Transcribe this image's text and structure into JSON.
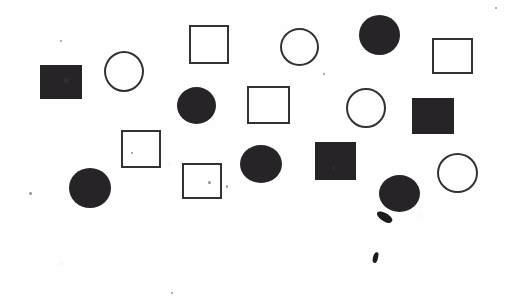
{
  "canvas": {
    "width": 511,
    "height": 299,
    "background_color": "#fefefe",
    "description": "Scanned white page with hand-drawn/printed geometric shapes"
  },
  "palette": {
    "fill_color": "#262426",
    "stroke_color": "#333134",
    "background_color": "#fefefe",
    "speck_color": "#3a3a3a"
  },
  "shape_counts": {
    "filled_square": 4,
    "open_square": 5,
    "filled_circle": 5,
    "open_circle": 4,
    "total": 18
  },
  "shapes": [
    {
      "id": "filled-square-1",
      "kind": "filled-square",
      "x": 40,
      "y": 65,
      "w": 42,
      "h": 34
    },
    {
      "id": "open-circle-1",
      "kind": "open-circle",
      "x": 104,
      "y": 51,
      "w": 40,
      "h": 41
    },
    {
      "id": "open-square-1",
      "kind": "open-square",
      "x": 189,
      "y": 25,
      "w": 40,
      "h": 39
    },
    {
      "id": "open-circle-2",
      "kind": "open-circle",
      "x": 280,
      "y": 28,
      "w": 39,
      "h": 38
    },
    {
      "id": "filled-circle-1",
      "kind": "filled-circle",
      "x": 359,
      "y": 15,
      "w": 41,
      "h": 40
    },
    {
      "id": "open-square-2",
      "kind": "open-square",
      "x": 432,
      "y": 38,
      "w": 41,
      "h": 36
    },
    {
      "id": "filled-circle-2",
      "kind": "filled-circle",
      "x": 177,
      "y": 87,
      "w": 39,
      "h": 37
    },
    {
      "id": "open-square-3",
      "kind": "open-square",
      "x": 247,
      "y": 86,
      "w": 43,
      "h": 38
    },
    {
      "id": "open-circle-3",
      "kind": "open-circle",
      "x": 346,
      "y": 88,
      "w": 40,
      "h": 40
    },
    {
      "id": "filled-square-2",
      "kind": "filled-square",
      "x": 412,
      "y": 98,
      "w": 42,
      "h": 36
    },
    {
      "id": "open-square-4",
      "kind": "open-square",
      "x": 121,
      "y": 130,
      "w": 40,
      "h": 38
    },
    {
      "id": "filled-circle-3",
      "kind": "filled-circle",
      "x": 240,
      "y": 145,
      "w": 42,
      "h": 38
    },
    {
      "id": "filled-square-3",
      "kind": "filled-square",
      "x": 315,
      "y": 142,
      "w": 41,
      "h": 38
    },
    {
      "id": "open-circle-4",
      "kind": "open-circle",
      "x": 437,
      "y": 153,
      "w": 41,
      "h": 40
    },
    {
      "id": "open-square-5",
      "kind": "open-square",
      "x": 182,
      "y": 163,
      "w": 40,
      "h": 36
    },
    {
      "id": "filled-circle-4",
      "kind": "filled-circle",
      "x": 69,
      "y": 168,
      "w": 42,
      "h": 40
    },
    {
      "id": "filled-circle-5",
      "kind": "filled-circle",
      "x": 379,
      "y": 175,
      "w": 41,
      "h": 37
    },
    {
      "id": "filled-square-4",
      "kind": "filled-square",
      "x": 40,
      "y": 65,
      "w": 0,
      "h": 0
    }
  ],
  "artifacts": [
    {
      "id": "streak-1",
      "kind": "ink-streak",
      "x": 376,
      "y": 213,
      "w": 17,
      "h": 8,
      "rotation": 34
    },
    {
      "id": "tick-1",
      "kind": "pen-tick",
      "x": 373,
      "y": 252,
      "w": 5,
      "h": 11,
      "rotation": 12
    },
    {
      "id": "speck-1",
      "kind": "dust-speck",
      "x": 29,
      "y": 192,
      "w": 3,
      "h": 3
    },
    {
      "id": "speck-2",
      "kind": "dust-speck",
      "x": 60,
      "y": 40,
      "w": 2,
      "h": 2
    },
    {
      "id": "speck-3",
      "kind": "dust-speck",
      "x": 495,
      "y": 7,
      "w": 2,
      "h": 2
    },
    {
      "id": "speck-4",
      "kind": "dust-speck",
      "x": 131,
      "y": 152,
      "w": 2,
      "h": 2
    },
    {
      "id": "speck-5",
      "kind": "dust-speck",
      "x": 208,
      "y": 181,
      "w": 3,
      "h": 3
    },
    {
      "id": "speck-6",
      "kind": "dust-speck",
      "x": 332,
      "y": 166,
      "w": 3,
      "h": 4
    },
    {
      "id": "speck-7",
      "kind": "dust-speck",
      "x": 64,
      "y": 78,
      "w": 5,
      "h": 5
    },
    {
      "id": "speck-8",
      "kind": "dust-speck",
      "x": 323,
      "y": 73,
      "w": 2,
      "h": 2
    },
    {
      "id": "speck-9",
      "kind": "dust-speck",
      "x": 171,
      "y": 292,
      "w": 2,
      "h": 2
    },
    {
      "id": "speck-10",
      "kind": "dust-speck",
      "x": 226,
      "y": 185,
      "w": 2,
      "h": 3
    }
  ]
}
